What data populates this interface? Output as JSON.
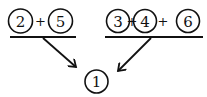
{
  "diagram": {
    "left_group": {
      "terms": [
        "2",
        "5"
      ],
      "operators": [
        "+"
      ]
    },
    "right_group": {
      "terms": [
        "3",
        "4",
        "6"
      ],
      "operators": [
        "+",
        "+"
      ]
    },
    "result": "1",
    "colors": {
      "stroke": "#111111",
      "background": "#ffffff"
    }
  }
}
